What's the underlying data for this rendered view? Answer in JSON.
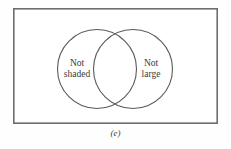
{
  "figure": {
    "caption": "(e)",
    "type": "venn-diagram",
    "universe": {
      "name": "universal-set-rectangle",
      "x": 13,
      "y": 8,
      "width": 205,
      "height": 116,
      "stroke_color": "#6d6d6d",
      "fill_color": "#ffffff"
    },
    "circles": [
      {
        "name": "left-set",
        "label_lines": [
          "Not",
          "shaded"
        ],
        "cx": 97,
        "cy": 69,
        "r": 40,
        "shaded": false,
        "stroke_color": "#5a5a5a",
        "fill_color": "none"
      },
      {
        "name": "right-set",
        "label_lines": [
          "Not",
          "large"
        ],
        "cx": 133,
        "cy": 69,
        "r": 40,
        "shaded": false,
        "stroke_color": "#5a5a5a",
        "fill_color": "none"
      }
    ],
    "intersection": {
      "name": "overlap-region",
      "shaded": false
    },
    "background_color": "#fefefe",
    "text_color": "#3a3a3a"
  }
}
